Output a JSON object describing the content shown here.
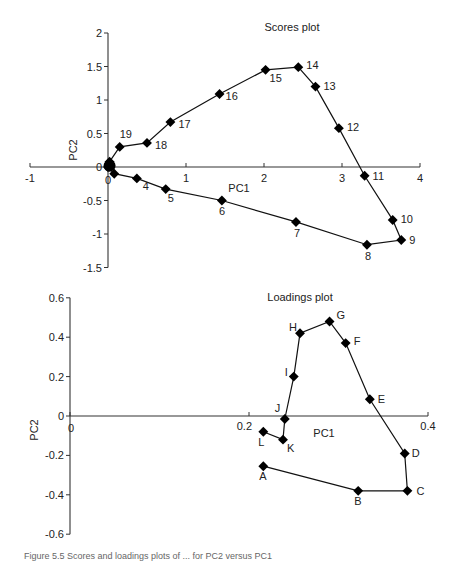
{
  "chart_data": [
    {
      "type": "scatter",
      "title": "Scores plot",
      "xlabel": "PC1",
      "ylabel": "PC2",
      "xlim": [
        -1,
        4
      ],
      "ylim": [
        -1.5,
        2
      ],
      "xticks": [
        "-1",
        "0",
        "1",
        "2",
        "3",
        "4"
      ],
      "yticks": [
        "-1.5",
        "-1",
        "-0.5",
        "0",
        "0.5",
        "1",
        "1.5",
        "2"
      ],
      "grid": false,
      "connected": true,
      "points": [
        {
          "label": "",
          "x": 0.0,
          "y": 0.0
        },
        {
          "label": "",
          "x": 0.08,
          "y": -0.1
        },
        {
          "label": "4",
          "x": 0.37,
          "y": -0.17
        },
        {
          "label": "5",
          "x": 0.74,
          "y": -0.33
        },
        {
          "label": "6",
          "x": 1.46,
          "y": -0.5
        },
        {
          "label": "7",
          "x": 2.41,
          "y": -0.82
        },
        {
          "label": "8",
          "x": 3.32,
          "y": -1.16
        },
        {
          "label": "9",
          "x": 3.76,
          "y": -1.09
        },
        {
          "label": "10",
          "x": 3.65,
          "y": -0.79
        },
        {
          "label": "11",
          "x": 3.29,
          "y": -0.13
        },
        {
          "label": "12",
          "x": 2.96,
          "y": 0.58
        },
        {
          "label": "13",
          "x": 2.66,
          "y": 1.2
        },
        {
          "label": "14",
          "x": 2.44,
          "y": 1.49
        },
        {
          "label": "15",
          "x": 2.02,
          "y": 1.45
        },
        {
          "label": "16",
          "x": 1.43,
          "y": 1.09
        },
        {
          "label": "17",
          "x": 0.8,
          "y": 0.67
        },
        {
          "label": "18",
          "x": 0.5,
          "y": 0.36
        },
        {
          "label": "19",
          "x": 0.15,
          "y": 0.3
        },
        {
          "label": "",
          "x": 0.02,
          "y": 0.08
        }
      ]
    },
    {
      "type": "scatter",
      "title": "Loadings plot",
      "xlabel": "PC1",
      "ylabel": "PC2",
      "xlim": [
        0,
        0.4
      ],
      "ylim": [
        -0.6,
        0.6
      ],
      "xticks": [
        "0",
        "0.2",
        "0.4"
      ],
      "yticks": [
        "-0.6",
        "-0.4",
        "-0.2",
        "0",
        "0.2",
        "0.4",
        "0.6"
      ],
      "grid": false,
      "connected": true,
      "points": [
        {
          "label": "A",
          "x": 0.216,
          "y": -0.255
        },
        {
          "label": "B",
          "x": 0.322,
          "y": -0.38
        },
        {
          "label": "C",
          "x": 0.377,
          "y": -0.38
        },
        {
          "label": "D",
          "x": 0.374,
          "y": -0.19
        },
        {
          "label": "E",
          "x": 0.335,
          "y": 0.085
        },
        {
          "label": "F",
          "x": 0.308,
          "y": 0.37
        },
        {
          "label": "G",
          "x": 0.29,
          "y": 0.48
        },
        {
          "label": "H",
          "x": 0.257,
          "y": 0.42
        },
        {
          "label": "I",
          "x": 0.25,
          "y": 0.2
        },
        {
          "label": "J",
          "x": 0.24,
          "y": -0.015
        },
        {
          "label": "K",
          "x": 0.238,
          "y": -0.12
        },
        {
          "label": "L",
          "x": 0.216,
          "y": -0.08
        }
      ]
    }
  ],
  "caption": "Figure 5.5 Scores and loadings plots of ... for PC2 versus PC1"
}
